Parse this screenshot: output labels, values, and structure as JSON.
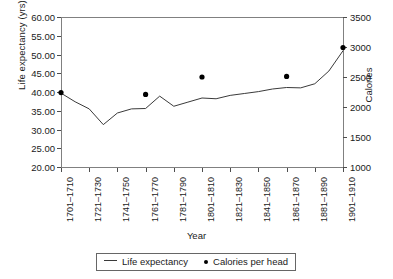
{
  "chart_data": {
    "type": "line",
    "title": "",
    "xlabel": "Year",
    "ylabel": "Life expectancy (yrs)",
    "ylabel_secondary": "Calories",
    "grid": false,
    "legend_position": "bottom",
    "ylim": [
      20.0,
      60.0
    ],
    "ytick_step": 5.0,
    "ylim_secondary": [
      1000,
      3500
    ],
    "ytick_step_secondary": 500,
    "ytick_labels": [
      "20.00",
      "25.00",
      "30.00",
      "35.00",
      "40.00",
      "45.00",
      "50.00",
      "55.00",
      "60.00"
    ],
    "ytick_values": [
      20.0,
      25.0,
      30.0,
      35.0,
      40.0,
      45.0,
      50.0,
      55.0,
      60.0
    ],
    "ytick_labels_secondary": [
      "1000",
      "1500",
      "2000",
      "2500",
      "3000",
      "3500"
    ],
    "ytick_values_secondary": [
      1000,
      1500,
      2000,
      2500,
      3000,
      3500
    ],
    "xtick_labels": [
      "1701–1710",
      "1721–1730",
      "1741–1750",
      "1761–1770",
      "1781–1790",
      "1801–1810",
      "1821–1830",
      "1841–1850",
      "1861–1870",
      "1881–1890",
      "1901–1910"
    ],
    "x_decades": [
      "1701–1710",
      "1711–1720",
      "1721–1730",
      "1731–1740",
      "1741–1750",
      "1751–1760",
      "1761–1770",
      "1771–1780",
      "1781–1790",
      "1791–1800",
      "1801–1810",
      "1811–1820",
      "1821–1830",
      "1831–1840",
      "1841–1850",
      "1851–1860",
      "1861–1870",
      "1871–1880",
      "1881–1890",
      "1891–1900",
      "1901–1910"
    ],
    "series": [
      {
        "name": "Life expectancy",
        "axis": "left",
        "unit": "yrs",
        "marker": "none",
        "style": "line",
        "values": [
          39.7,
          37.4,
          35.5,
          31.3,
          34.4,
          35.5,
          35.6,
          38.9,
          36.2,
          37.3,
          38.4,
          38.2,
          39.1,
          39.6,
          40.1,
          40.8,
          41.2,
          41.1,
          42.2,
          45.6,
          51.0
        ]
      },
      {
        "name": "Calories per head",
        "axis": "right",
        "unit": "calories",
        "marker": "dot",
        "style": "points",
        "points": [
          {
            "x": "1701–1710",
            "x_index": 0,
            "value": 2240
          },
          {
            "x": "1761–1770",
            "x_index": 6,
            "value": 2210
          },
          {
            "x": "1801–1810",
            "x_index": 10,
            "value": 2500
          },
          {
            "x": "1861–1870",
            "x_index": 16,
            "value": 2510
          },
          {
            "x": "1901–1910",
            "x_index": 20,
            "value": 2990
          }
        ]
      }
    ]
  },
  "legend": {
    "entry_line_label": "Life expectancy",
    "entry_dot_label": "Calories per head"
  },
  "colors": {
    "line": "#3a3a3a",
    "marker": "#000000",
    "axis": "#808080",
    "text": "#1a1a1a"
  }
}
